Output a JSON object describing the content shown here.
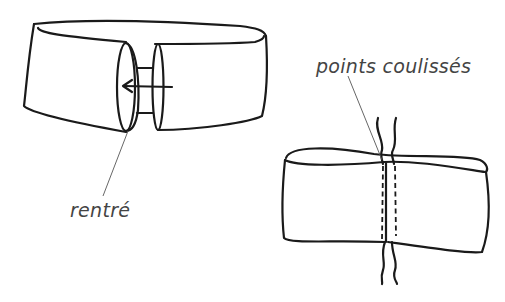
{
  "diagram": {
    "figures": [
      {
        "id": "band-open",
        "description": "Band with two ends being joined, one end tucked inside the other (arrow shows direction)",
        "label": "rentré"
      },
      {
        "id": "band-sewn",
        "description": "Band joined with gathered/running stitches along the seam, thread ends visible",
        "label": "points coulissés"
      }
    ],
    "labels": {
      "tucked": "rentré",
      "stitches": "points coulissés"
    },
    "colors": {
      "ink": "#1a1a1a",
      "label_text": "#444444",
      "background": "#ffffff"
    }
  }
}
